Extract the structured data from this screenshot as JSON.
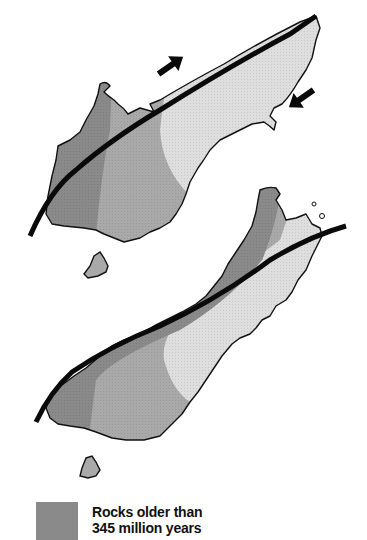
{
  "diagram": {
    "panels": [
      {
        "name": "reconstructed-past",
        "position": "top",
        "fault": "straight",
        "arrows": [
          "northeast-arrow",
          "southwest-arrow"
        ]
      },
      {
        "name": "present-day",
        "position": "bottom",
        "fault": "offset"
      }
    ],
    "zones": [
      {
        "name": "rocks-older-than-345my",
        "color": "#8a8a8a"
      },
      {
        "name": "intermediate-rocks",
        "color": "#a9a9a9"
      },
      {
        "name": "younger-rocks",
        "color": "#dedede"
      }
    ],
    "fault_color": "#0a0a0a",
    "outline_color": "#111111"
  },
  "legend": {
    "items": [
      {
        "swatch_color": "#8a8a8a",
        "line1": "Rocks older than",
        "line2": "345 million years"
      }
    ]
  }
}
